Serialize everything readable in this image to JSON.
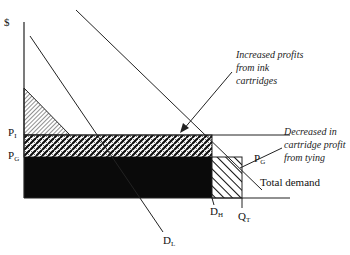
{
  "diagram": {
    "axis": {
      "y_label": "$"
    },
    "price_labels": {
      "p_i": {
        "main": "P",
        "sub": "I"
      },
      "p_g": {
        "main": "P",
        "sub": "G"
      },
      "p_g_right": {
        "main": "P",
        "sub": "G"
      }
    },
    "quantity_labels": {
      "d_h": {
        "main": "D",
        "sub": "H"
      },
      "q_t": {
        "main": "Q",
        "sub": "T"
      },
      "d_l": {
        "main": "D",
        "sub": "L"
      }
    },
    "curves": {
      "total_demand": "Total demand"
    },
    "annotations": {
      "increased_profits": [
        "Increased profits",
        "from ink",
        "cartridges"
      ],
      "decreased_profit": [
        "Decreased in",
        "cartridge profit",
        "from tying"
      ]
    },
    "colors": {
      "line": "#222222",
      "fill_dark": "#0a0a0a",
      "background": "#ffffff"
    }
  }
}
